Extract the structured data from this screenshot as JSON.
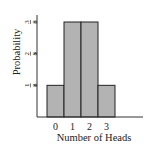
{
  "chart_data": {
    "type": "bar",
    "title": "",
    "xlabel": "Number of Heads",
    "ylabel": "Probability",
    "categories": [
      "0",
      "1",
      "2",
      "3"
    ],
    "values": [
      0.125,
      0.375,
      0.375,
      0.125
    ],
    "ylim": [
      0,
      0.375
    ],
    "yticks": [
      {
        "value": 0.125,
        "num": "1",
        "den": "8"
      },
      {
        "value": 0.25,
        "num": "2",
        "den": "8"
      },
      {
        "value": 0.375,
        "num": "3",
        "den": "8"
      }
    ],
    "grid": false,
    "legend": "none",
    "bar_fill": "#b3b3b3",
    "bar_stroke": "#222222"
  }
}
